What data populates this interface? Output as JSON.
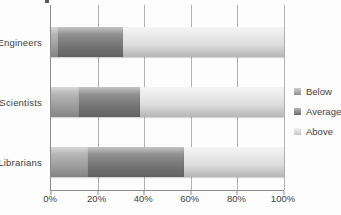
{
  "figure": {
    "background": "#fdfdfd",
    "axis_color": "#8c8c8c",
    "gridline_color": "#b3b3b3",
    "text_color": "#3d3d3d"
  },
  "legend": {
    "position": "right",
    "items": [
      {
        "label": "Below",
        "color": "#a8a8a8"
      },
      {
        "label": "Average",
        "color": "#7d7d7d"
      },
      {
        "label": "Above",
        "color": "#e8e8e8"
      }
    ]
  },
  "chart_data": {
    "type": "bar",
    "orientation": "horizontal",
    "stacked": true,
    "categories": [
      "Engineers",
      "Scientists",
      "Librarians"
    ],
    "series": [
      {
        "name": "Below",
        "color": "#a8a8a8",
        "values": [
          3,
          12,
          16
        ]
      },
      {
        "name": "Average",
        "color": "#7d7d7d",
        "values": [
          28,
          26,
          41
        ]
      },
      {
        "name": "Above",
        "color": "#e8e8e8",
        "values": [
          69,
          62,
          43
        ]
      }
    ],
    "x_ticks": [
      "0%",
      "20%",
      "40%",
      "60%",
      "80%",
      "100%"
    ],
    "xlim": [
      0,
      100
    ],
    "grid": "vertical",
    "legend_position": "right",
    "title": "",
    "xlabel": "",
    "ylabel": ""
  }
}
